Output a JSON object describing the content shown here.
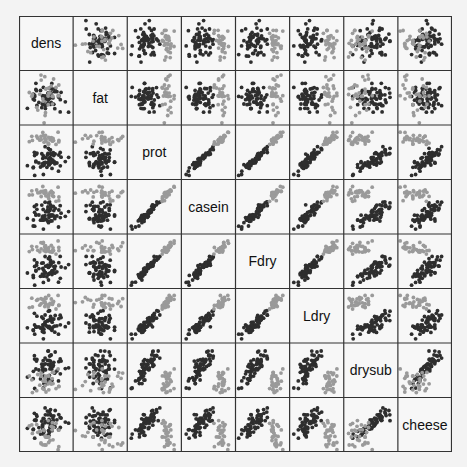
{
  "chart_data": {
    "type": "scatter",
    "subtype": "scatterplot-matrix",
    "variables": [
      "dens",
      "fat",
      "prot",
      "casein",
      "Fdry",
      "Ldry",
      "drysub",
      "cheese"
    ],
    "groups": [
      {
        "name": "group-dark",
        "color": "#2e2e2e"
      },
      {
        "name": "group-light",
        "color": "#9a9a9a"
      }
    ],
    "layout": {
      "rows": 8,
      "cols": 8,
      "diagonal": "variable-labels",
      "axes_ticks": false,
      "grid": false
    },
    "correlation_patterns": {
      "prot-casein": "strong-positive",
      "prot-Fdry": "strong-positive",
      "prot-Ldry": "strong-positive",
      "casein-Fdry": "strong-positive",
      "casein-Ldry": "strong-positive",
      "Fdry-Ldry": "strong-positive",
      "drysub-cheese": "positive",
      "dens-others": "weak",
      "fat-others": "weak"
    }
  },
  "colors": {
    "background": "#f3f3f3",
    "panel": "#f7f7f7",
    "grid_line": "#333333",
    "dark_points": "#2e2e2e",
    "light_points": "#9a9a9a"
  }
}
